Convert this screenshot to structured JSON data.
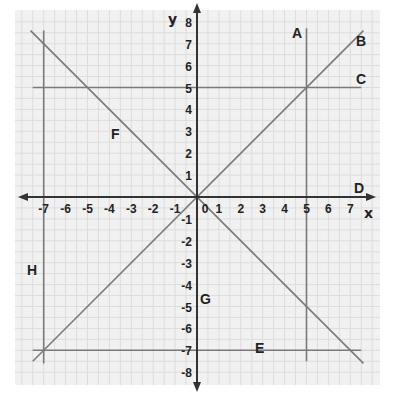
{
  "chart_data": {
    "type": "diagram",
    "title": "",
    "xlabel": "x",
    "ylabel": "y",
    "xlim": [
      -8,
      8
    ],
    "ylim": [
      -8,
      8
    ],
    "grid": true,
    "x_ticks": [
      "-7",
      "-6",
      "-5",
      "-4",
      "-3",
      "-2",
      "-1",
      "0",
      "1",
      "2",
      "3",
      "4",
      "5",
      "6",
      "7"
    ],
    "y_ticks": [
      "8",
      "7",
      "6",
      "5",
      "4",
      "3",
      "2",
      "1",
      "-1",
      "-2",
      "-3",
      "-4",
      "-5",
      "-6",
      "-7",
      "-8"
    ],
    "lines": [
      {
        "label": "A",
        "equation": "x = 5"
      },
      {
        "label": "B",
        "equation": "y = x"
      },
      {
        "label": "C",
        "equation": "y = 5"
      },
      {
        "label": "D",
        "equation": "y = 0"
      },
      {
        "label": "E",
        "equation": "y = -7"
      },
      {
        "label": "F",
        "equation": "y = -x"
      },
      {
        "label": "G",
        "equation": "x = 0"
      },
      {
        "label": "H",
        "equation": "x = -7"
      }
    ]
  },
  "labels": {
    "x_axis": "x",
    "y_axis": "y",
    "A": "A",
    "B": "B",
    "C": "C",
    "D": "D",
    "E": "E",
    "F": "F",
    "G": "G",
    "H": "H"
  },
  "colors": {
    "panel": "#f1f1f1",
    "grid": "#dcdcdc",
    "axis": "#333333",
    "lines": "#7a7a7a",
    "text": "#222222"
  }
}
